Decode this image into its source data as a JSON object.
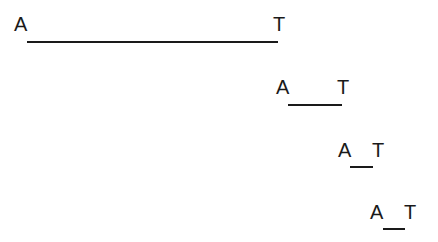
{
  "figure": {
    "background_color": "#ffffff",
    "ink_color": "#1a1a1a",
    "width": 438,
    "height": 242
  },
  "chart_data": {
    "type": "diagram",
    "title": "",
    "subtitle": "",
    "xlabel": "",
    "ylabel": "",
    "grid": false,
    "legend": null,
    "left_label": "A",
    "right_label": "T",
    "rows": [
      {
        "index": 1,
        "left_label": "A",
        "right_label": "T",
        "label_y": 14,
        "left_label_x": 14,
        "right_label_x": 273,
        "rule_x_start": 27,
        "rule_x_end": 278,
        "rule_y": 41,
        "rule_length": 251
      },
      {
        "index": 2,
        "left_label": "A",
        "right_label": "T",
        "label_y": 77,
        "left_label_x": 276,
        "right_label_x": 337,
        "rule_x_start": 288,
        "rule_x_end": 342,
        "rule_y": 104,
        "rule_length": 54
      },
      {
        "index": 3,
        "left_label": "A",
        "right_label": "T",
        "label_y": 140,
        "left_label_x": 338,
        "right_label_x": 372,
        "rule_x_start": 350,
        "rule_x_end": 373,
        "rule_y": 166,
        "rule_length": 23
      },
      {
        "index": 4,
        "left_label": "A",
        "right_label": "T",
        "label_y": 202,
        "left_label_x": 370,
        "right_label_x": 404,
        "rule_x_start": 383,
        "rule_x_end": 405,
        "rule_y": 228,
        "rule_length": 22
      }
    ]
  }
}
